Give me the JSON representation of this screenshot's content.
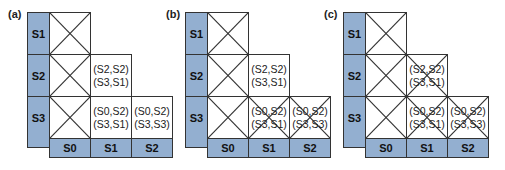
{
  "colors": {
    "label_fill": "#93afd0",
    "border": "#333333"
  },
  "row_labels": [
    "S1",
    "S2",
    "S3"
  ],
  "col_labels": [
    "S0",
    "S1",
    "S2"
  ],
  "panels": [
    {
      "label": "(a)",
      "cells": {
        "s2_s1": [
          "(S2,S2)",
          "(S3,S1)"
        ],
        "s3_s1": [
          "(S0,S2)",
          "(S3,S1)"
        ],
        "s3_s2": [
          "(S0,S2)",
          "(S3,S3)"
        ]
      },
      "crossed": [
        "s1_s0",
        "s2_s0",
        "s3_s0"
      ]
    },
    {
      "label": "(b)",
      "cells": {
        "s2_s1": [
          "(S2,S2)",
          "(S3,S1)"
        ],
        "s3_s1": [
          "(S0,S2)",
          "(S3,S1)"
        ],
        "s3_s2": [
          "(S0,S2)",
          "(S3,S3)"
        ]
      },
      "crossed": [
        "s1_s0",
        "s2_s0",
        "s3_s0",
        "s3_s1",
        "s3_s2"
      ]
    },
    {
      "label": "(c)",
      "cells": {
        "s2_s1": [
          "(S2,S2)",
          "(S3,S1)"
        ],
        "s3_s1": [
          "(S0,S2)",
          "(S3,S1)"
        ],
        "s3_s2": [
          "(S0,S2)",
          "(S3,S3)"
        ]
      },
      "crossed": [
        "s1_s0",
        "s2_s0",
        "s3_s0",
        "s2_s1",
        "s3_s1",
        "s3_s2"
      ]
    }
  ]
}
